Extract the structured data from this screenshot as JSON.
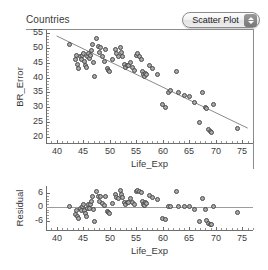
{
  "header": {
    "panel_title": "Countries",
    "plot_type_selector": {
      "label": "Scatter Plot",
      "icon": "stepper-updown-icon",
      "options": [
        "Scatter Plot"
      ]
    }
  },
  "chart_data": [
    {
      "id": "scatter-main",
      "type": "scatter",
      "title": "",
      "xlabel": "Life_Exp",
      "ylabel": "BR_Error",
      "xlim": [
        38,
        77
      ],
      "ylim": [
        18,
        56
      ],
      "xticks": [
        40,
        45,
        50,
        55,
        60,
        65,
        70,
        75
      ],
      "yticks": [
        20,
        25,
        30,
        35,
        40,
        45,
        50,
        55
      ],
      "grid": false,
      "legend": "none",
      "fit_line": {
        "x": [
          40.0,
          76.0
        ],
        "y": [
          54.0,
          23.0
        ],
        "style": "solid-thin-gray"
      },
      "x": [
        42.5,
        43.5,
        43.8,
        44.0,
        44.2,
        44.5,
        44.6,
        44.8,
        45.0,
        45.2,
        45.4,
        45.6,
        45.8,
        46.0,
        46.2,
        46.4,
        46.6,
        46.8,
        47.0,
        47.2,
        47.5,
        47.8,
        48.0,
        48.3,
        48.6,
        49.0,
        49.2,
        49.5,
        49.8,
        50.0,
        50.5,
        51.0,
        51.3,
        51.6,
        52.0,
        52.2,
        52.5,
        52.8,
        53.0,
        53.3,
        53.6,
        54.0,
        54.3,
        54.6,
        55.0,
        55.3,
        55.6,
        56.0,
        56.2,
        56.4,
        56.6,
        56.8,
        57.0,
        57.5,
        58.0,
        59.0,
        60.0,
        60.5,
        61.0,
        61.5,
        62.5,
        63.0,
        64.0,
        65.0,
        66.0,
        67.0,
        67.5,
        68.0,
        68.3,
        68.6,
        69.0,
        69.2,
        69.5,
        74.0
      ],
      "y": [
        51.0,
        46.0,
        47.5,
        44.5,
        43.0,
        47.0,
        46.0,
        47.5,
        48.0,
        45.5,
        44.0,
        43.5,
        47.0,
        48.0,
        46.5,
        47.5,
        49.0,
        51.0,
        45.0,
        40.5,
        53.0,
        50.5,
        48.5,
        50.0,
        47.0,
        45.5,
        49.5,
        43.0,
        42.5,
        42.0,
        46.0,
        49.5,
        48.0,
        47.0,
        50.0,
        48.5,
        47.0,
        44.5,
        43.5,
        44.0,
        44.0,
        45.0,
        43.5,
        42.5,
        47.5,
        48.0,
        47.0,
        46.0,
        42.0,
        41.0,
        40.5,
        41.5,
        41.0,
        44.0,
        43.0,
        41.0,
        31.0,
        30.0,
        35.0,
        35.5,
        42.0,
        35.0,
        34.0,
        33.5,
        31.5,
        25.0,
        35.0,
        30.0,
        29.5,
        22.5,
        22.0,
        21.5,
        31.0,
        23.0
      ]
    },
    {
      "id": "residual-plot",
      "type": "scatter",
      "title": "",
      "xlabel": "Life_Exp",
      "ylabel": "Residual",
      "xlim": [
        38,
        77
      ],
      "ylim": [
        -10,
        9
      ],
      "xticks": [
        40,
        45,
        50,
        55,
        60,
        65,
        70,
        75
      ],
      "yticks": [
        -6,
        0,
        6
      ],
      "grid": false,
      "legend": "none",
      "reference_line": 0,
      "x": [
        42.5,
        43.5,
        43.8,
        44.0,
        44.2,
        44.5,
        44.6,
        44.8,
        45.0,
        45.2,
        45.4,
        45.6,
        45.8,
        46.0,
        46.2,
        46.4,
        46.6,
        46.8,
        47.0,
        47.2,
        47.5,
        47.8,
        48.0,
        48.3,
        48.6,
        49.0,
        49.2,
        49.5,
        49.8,
        50.0,
        50.5,
        51.0,
        51.3,
        51.6,
        52.0,
        52.2,
        52.5,
        52.8,
        53.0,
        53.3,
        53.6,
        54.0,
        54.3,
        54.6,
        55.0,
        55.3,
        55.6,
        56.0,
        56.2,
        56.4,
        56.6,
        56.8,
        57.0,
        57.5,
        58.0,
        59.0,
        60.0,
        60.5,
        61.0,
        61.5,
        62.5,
        63.0,
        64.0,
        65.0,
        66.0,
        67.0,
        67.5,
        68.0,
        68.3,
        68.6,
        69.0,
        69.2,
        69.5,
        74.0
      ],
      "y": [
        0.0,
        -3.5,
        -1.5,
        -4.0,
        -5.0,
        -0.5,
        -1.5,
        0.0,
        1.0,
        -1.5,
        -3.0,
        -4.0,
        -0.5,
        1.0,
        -0.5,
        1.0,
        2.5,
        4.5,
        -1.0,
        -6.5,
        6.5,
        4.5,
        2.5,
        4.5,
        1.5,
        0.5,
        4.5,
        -2.0,
        -2.5,
        -3.0,
        1.5,
        5.5,
        4.0,
        3.5,
        7.0,
        5.5,
        4.0,
        2.0,
        1.0,
        2.0,
        2.0,
        3.5,
        2.0,
        1.0,
        6.5,
        7.0,
        6.5,
        6.0,
        2.5,
        1.0,
        0.5,
        2.0,
        1.5,
        5.0,
        4.0,
        3.0,
        -5.0,
        -5.5,
        0.0,
        0.0,
        6.5,
        0.0,
        0.0,
        0.0,
        -1.0,
        -6.5,
        3.5,
        -1.0,
        -6.0,
        -7.0,
        -7.5,
        -7.5,
        0.0,
        -2.5
      ]
    }
  ]
}
